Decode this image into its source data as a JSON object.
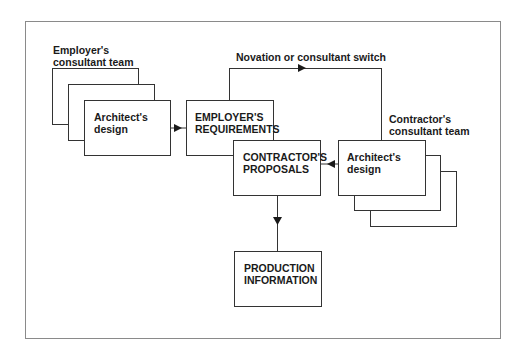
{
  "diagram": {
    "labels": {
      "employer_team": "Employer's\nconsultant team",
      "contractor_team": "Contractor's\nconsultant team",
      "novation": "Novation or consultant switch"
    },
    "nodes": {
      "employer_architect": "Architect's\ndesign",
      "employers_requirements": "EMPLOYER'S\nREQUIREMENTS",
      "contractors_proposals": "CONTRACTOR'S\nPROPOSALS",
      "contractor_architect": "Architect's\ndesign",
      "production_information": "PRODUCTION\nINFORMATION"
    },
    "edges": [
      {
        "from": "employer_architect",
        "to": "employers_requirements"
      },
      {
        "from": "employers_requirements",
        "to": "contractor_architect",
        "label": "Novation or consultant switch"
      },
      {
        "from": "contractor_architect",
        "to": "contractors_proposals"
      },
      {
        "from": "contractors_proposals",
        "to": "production_information"
      }
    ]
  }
}
